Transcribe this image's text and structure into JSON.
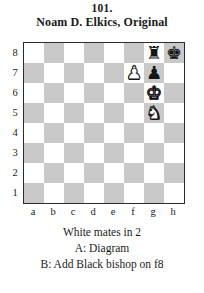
{
  "title": {
    "problem_number": "101.",
    "composer": "Noam D. Elkics, Original"
  },
  "board": {
    "light_square_color": "#ffffff",
    "dark_square_color": "#c9c9c9",
    "border_color": "#2b2b2b",
    "file_labels": [
      "a",
      "b",
      "c",
      "d",
      "e",
      "f",
      "g",
      "h"
    ],
    "rank_labels": [
      "8",
      "7",
      "6",
      "5",
      "4",
      "3",
      "2",
      "1"
    ],
    "orientation": "white-bottom",
    "pieces": [
      {
        "square": "g8",
        "color": "black",
        "type": "rook",
        "glyph": "♜"
      },
      {
        "square": "h8",
        "color": "black",
        "type": "king",
        "glyph": "♚"
      },
      {
        "square": "f7",
        "color": "white",
        "type": "pawn",
        "glyph": "♟"
      },
      {
        "square": "g7",
        "color": "black",
        "type": "pawn",
        "glyph": "♟"
      },
      {
        "square": "g6",
        "color": "white",
        "type": "king",
        "glyph": "♚"
      },
      {
        "square": "g5",
        "color": "white",
        "type": "knight",
        "glyph": "♞"
      }
    ]
  },
  "caption": {
    "stipulation": "White mates in 2",
    "twin_a": "A: Diagram",
    "twin_b": "B: Add Black bishop on f8"
  }
}
